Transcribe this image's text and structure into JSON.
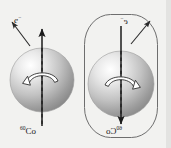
{
  "figure": {
    "background_color": "#f2f2f0",
    "ink_color": "#1b1b1b"
  },
  "panels": [
    {
      "id": "real",
      "name": "original-system",
      "framed": false,
      "nucleus_label": "Co",
      "nucleus_mass_number": "60",
      "electron_label": "e",
      "electron_charge": "−",
      "spin_axis_direction": "up",
      "spin_rotation": "counterclockwise",
      "electron_emission_direction": "up-left",
      "sphere": {
        "cx": 42,
        "cy": 80,
        "r": 32,
        "highlight_color": "#fdfdfd",
        "shade_color": "#8e8e8e"
      }
    },
    {
      "id": "mirror",
      "name": "mirror-image-system",
      "framed": true,
      "nucleus_label": "Co",
      "nucleus_mass_number": "60",
      "electron_label": "e",
      "electron_charge": "−",
      "spin_axis_direction": "down",
      "spin_rotation": "clockwise",
      "electron_emission_direction": "up-right",
      "sphere": {
        "cx": 121,
        "cy": 84,
        "r": 33,
        "highlight_color": "#fdfdfd",
        "shade_color": "#8e8e8e"
      },
      "frame": {
        "x": 84,
        "y": 14,
        "width": 74,
        "height": 124,
        "stroke": "#6a6a6a",
        "shape": "rounded-rectangle"
      }
    }
  ],
  "labels": {
    "electron_left": "e",
    "electron_left_sup": "−",
    "nucleus_left_sup": "60",
    "nucleus_left": "Co",
    "electron_right": "e",
    "electron_right_sup": "−",
    "nucleus_right_sup": "60",
    "nucleus_right": "Co"
  }
}
